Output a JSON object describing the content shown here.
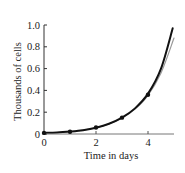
{
  "chart_data": {
    "type": "line",
    "title": "",
    "xlabel": "Time in days",
    "ylabel": "Thousands of cells",
    "xlim": [
      0,
      5
    ],
    "ylim": [
      0,
      1.0
    ],
    "x_ticks": [
      0,
      2,
      4
    ],
    "x_tick_labels": [
      "0",
      "2",
      "4"
    ],
    "y_ticks": [
      0,
      0.2,
      0.4,
      0.6,
      0.8,
      1.0
    ],
    "y_tick_labels": [
      "0",
      "0.2",
      "0.4",
      "0.6",
      "0.8",
      "1.0"
    ],
    "grid": false,
    "legend": null,
    "series": [
      {
        "name": "Data points",
        "kind": "scatter",
        "color": "#111111",
        "x": [
          0,
          1,
          2,
          3,
          4
        ],
        "y": [
          0.01,
          0.02,
          0.06,
          0.15,
          0.36
        ]
      },
      {
        "name": "Model curve (black)",
        "kind": "line",
        "color": "#111111",
        "x": [
          0,
          0.5,
          1,
          1.5,
          2,
          2.5,
          3,
          3.5,
          4,
          4.5,
          4.95
        ],
        "y": [
          0.01,
          0.013,
          0.022,
          0.035,
          0.058,
          0.094,
          0.15,
          0.235,
          0.37,
          0.6,
          0.97
        ]
      },
      {
        "name": "Model curve (gray)",
        "kind": "line",
        "color": "#999999",
        "x": [
          0,
          0.5,
          1,
          1.5,
          2,
          2.5,
          3,
          3.5,
          4,
          4.5,
          5.0
        ],
        "y": [
          0.01,
          0.013,
          0.022,
          0.035,
          0.057,
          0.092,
          0.146,
          0.228,
          0.355,
          0.56,
          0.88
        ]
      }
    ]
  }
}
